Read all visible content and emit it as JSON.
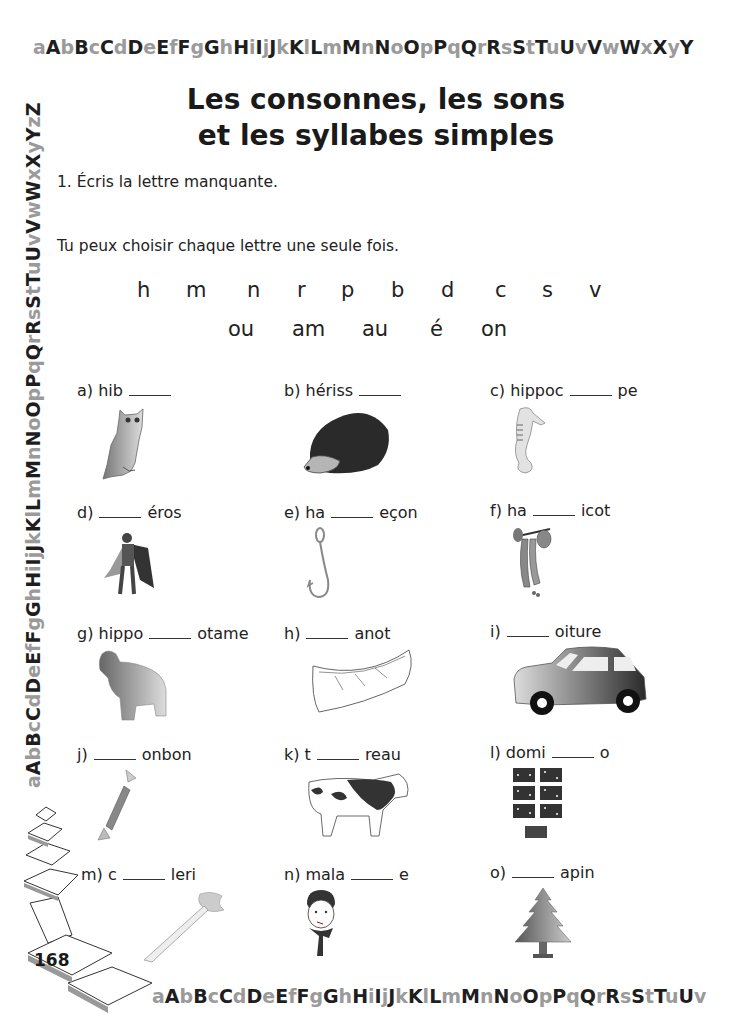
{
  "alphabet_border": {
    "top": "aAbBcCdDeEfFgGhHiIjJkKlLmMnNoOpPqQrRsStTuUvVwWxXyY",
    "left": "aAbBcCdDeEfFgGhHiIjJkKlLmMnNoOpPqQrRsStTuUvVwWxXyYzZ",
    "bottom": "aAbBcCdDeEfFgGhHiIjJkKlLmMnNoOpPqQrRsStTuUv"
  },
  "title": {
    "line1": "Les consonnes, les sons",
    "line2": "et les syllabes simples"
  },
  "exercise": {
    "instruction": "1. Écris la lettre manquante.",
    "hint": "Tu peux choisir chaque lettre une seule fois.",
    "letters": [
      "h",
      "m",
      "n",
      "r",
      "p",
      "b",
      "d",
      "c",
      "s",
      "v"
    ],
    "sounds": [
      "ou",
      "am",
      "au",
      "é",
      "on"
    ],
    "items": [
      {
        "id": "a",
        "prefix": "a) hib",
        "suffix": "",
        "picture": "owl"
      },
      {
        "id": "b",
        "prefix": "b) hériss",
        "suffix": "",
        "picture": "hedgehog"
      },
      {
        "id": "c",
        "prefix": "c) hippoc",
        "suffix": "pe",
        "picture": "seahorse"
      },
      {
        "id": "d",
        "prefix": "d)",
        "suffix": "éros",
        "picture": "superhero"
      },
      {
        "id": "e",
        "prefix": "e) ha",
        "suffix": "eçon",
        "picture": "fishhook"
      },
      {
        "id": "f",
        "prefix": "f) ha",
        "suffix": "icot",
        "picture": "green-beans"
      },
      {
        "id": "g",
        "prefix": "g) hippo",
        "suffix": "otame",
        "picture": "hippopotamus"
      },
      {
        "id": "h",
        "prefix": "h)",
        "suffix": "anot",
        "picture": "canoe"
      },
      {
        "id": "i",
        "prefix": "i)",
        "suffix": "oiture",
        "picture": "car"
      },
      {
        "id": "j",
        "prefix": "j)",
        "suffix": "onbon",
        "picture": "candy"
      },
      {
        "id": "k",
        "prefix": "k) t",
        "suffix": "reau",
        "picture": "bull"
      },
      {
        "id": "l",
        "prefix": "l) domi",
        "suffix": "o",
        "picture": "dominoes"
      },
      {
        "id": "m",
        "prefix": "m) c",
        "suffix": "leri",
        "picture": "celery"
      },
      {
        "id": "n",
        "prefix": "n) mala",
        "suffix": "e",
        "picture": "sick-boy"
      },
      {
        "id": "o",
        "prefix": "o)",
        "suffix": "apin",
        "picture": "fir-tree"
      }
    ]
  },
  "page_number": "168"
}
